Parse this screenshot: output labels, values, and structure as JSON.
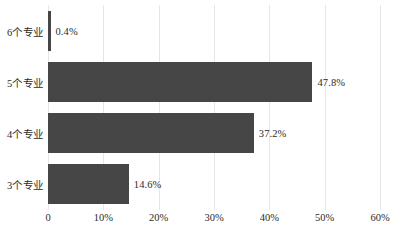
{
  "chart_data": {
    "type": "bar",
    "orientation": "horizontal",
    "title": "",
    "subtitle": "",
    "xlabel": "",
    "ylabel": "",
    "categories": [
      "6个专业",
      "5个专业",
      "4个专业",
      "3个专业"
    ],
    "values": [
      0.4,
      47.8,
      37.2,
      14.6
    ],
    "value_labels": [
      "0.4%",
      "47.8%",
      "37.2%",
      "14.6%"
    ],
    "xlim": [
      0,
      60
    ],
    "ylim": null,
    "x_ticks": [
      0,
      10,
      20,
      30,
      40,
      50,
      60
    ],
    "x_tick_labels": [
      "0",
      "10%",
      "20%",
      "30%",
      "40%",
      "50%",
      "60%"
    ],
    "grid": "vertical",
    "legend": null,
    "legend_position": "none",
    "bar_color": "#464646",
    "grid_color": "#e6e6e6",
    "text_color": "#2b2b2b",
    "background_color": "#ffffff"
  }
}
